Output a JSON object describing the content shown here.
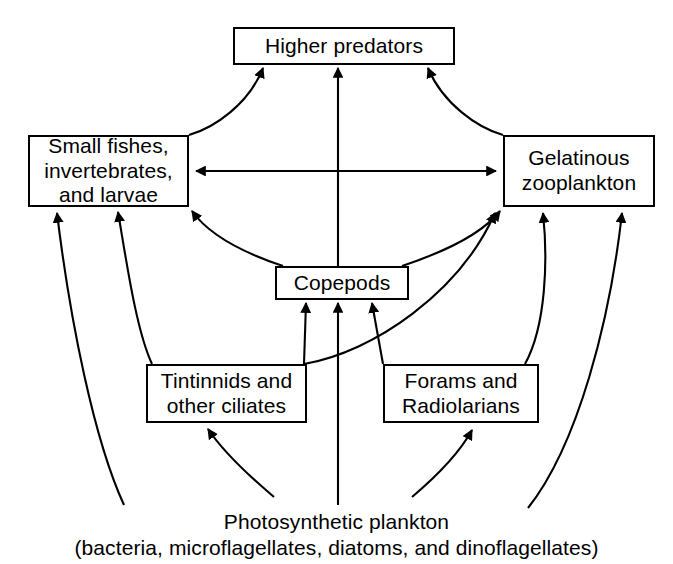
{
  "diagram": {
    "type": "food-web",
    "stroke_color": "#000000",
    "background_color": "#ffffff",
    "nodes": [
      {
        "id": "higher-predators",
        "lines": [
          "Higher predators"
        ],
        "boxed": true
      },
      {
        "id": "small-fishes",
        "lines": [
          "Small fishes,",
          "invertebrates,",
          "and larvae"
        ],
        "boxed": true
      },
      {
        "id": "gelatinous-zooplankton",
        "lines": [
          "Gelatinous",
          "zooplankton"
        ],
        "boxed": true
      },
      {
        "id": "copepods",
        "lines": [
          "Copepods"
        ],
        "boxed": true
      },
      {
        "id": "tintinnids",
        "lines": [
          "Tintinnids and",
          "other ciliates"
        ],
        "boxed": true
      },
      {
        "id": "forams",
        "lines": [
          "Forams and",
          "Radiolarians"
        ],
        "boxed": true
      },
      {
        "id": "photosynthetic-plankton",
        "lines": [
          "Photosynthetic plankton",
          "(bacteria, microflagellates, diatoms, and dinoflagellates)"
        ],
        "boxed": false
      }
    ],
    "edges": [
      {
        "from": "small-fishes",
        "to": "higher-predators",
        "style": "curved",
        "heads": 1
      },
      {
        "from": "copepods",
        "to": "higher-predators",
        "style": "straight",
        "heads": 1
      },
      {
        "from": "gelatinous-zooplankton",
        "to": "higher-predators",
        "style": "curved",
        "heads": 1
      },
      {
        "from": "small-fishes",
        "to": "gelatinous-zooplankton",
        "style": "straight",
        "heads": 2
      },
      {
        "from": "copepods",
        "to": "small-fishes",
        "style": "curved",
        "heads": 1
      },
      {
        "from": "copepods",
        "to": "gelatinous-zooplankton",
        "style": "curved",
        "heads": 1
      },
      {
        "from": "tintinnids",
        "to": "small-fishes",
        "style": "curved",
        "heads": 1
      },
      {
        "from": "tintinnids",
        "to": "copepods",
        "style": "straight",
        "heads": 1
      },
      {
        "from": "tintinnids",
        "to": "gelatinous-zooplankton",
        "style": "curved",
        "heads": 1
      },
      {
        "from": "forams",
        "to": "copepods",
        "style": "straight",
        "heads": 1
      },
      {
        "from": "forams",
        "to": "gelatinous-zooplankton",
        "style": "curved",
        "heads": 1
      },
      {
        "from": "photosynthetic-plankton",
        "to": "small-fishes",
        "style": "curved",
        "heads": 1
      },
      {
        "from": "photosynthetic-plankton",
        "to": "tintinnids",
        "style": "curved",
        "heads": 1
      },
      {
        "from": "photosynthetic-plankton",
        "to": "copepods",
        "style": "straight",
        "heads": 1
      },
      {
        "from": "photosynthetic-plankton",
        "to": "forams",
        "style": "curved",
        "heads": 1
      },
      {
        "from": "photosynthetic-plankton",
        "to": "gelatinous-zooplankton",
        "style": "curved",
        "heads": 1
      }
    ]
  }
}
